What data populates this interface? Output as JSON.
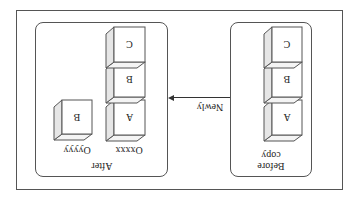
{
  "diagram": {
    "type": "copy-on-write illustration",
    "before_group": {
      "label_line1": "Before",
      "label_line2": "copy",
      "blocks": [
        "A",
        "B",
        "C"
      ]
    },
    "arrow": {
      "label": "Newly",
      "direction": "before-to-after"
    },
    "after_group": {
      "label": "After",
      "objects": [
        {
          "name": "Oxxxx",
          "blocks": [
            "A",
            "B",
            "C"
          ]
        },
        {
          "name": "Oyyyy",
          "blocks": [
            "B"
          ]
        }
      ]
    },
    "colors": {
      "stroke": "#555555",
      "cube_front": "#ffffff",
      "cube_side": "#e6e6e6",
      "cube_top": "#f4f4f4"
    },
    "orientation": "rotated 180 degrees"
  }
}
